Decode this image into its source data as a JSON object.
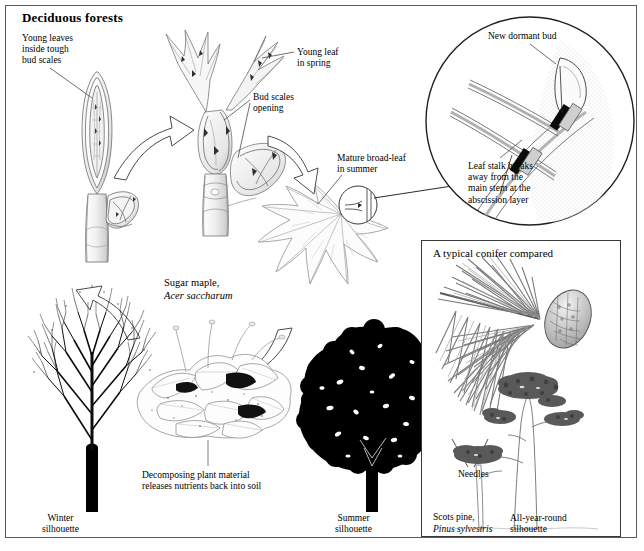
{
  "figure": {
    "title": "Deciduous forests",
    "subject_common_name": "Sugar maple,",
    "subject_latin_name": "Acer saccharum"
  },
  "labels": {
    "young_leaves": "Young leaves\ninside tough\nbud scales",
    "young_leaf_spring": "Young leaf\nin spring",
    "bud_scales_opening": "Bud scales\nopening",
    "mature_leaf_summer": "Mature broad-leaf\nin summer",
    "new_dormant_bud": "New dormant bud",
    "leaf_stalk_breaks": "Leaf stalk breaks\naway from the\nmain stem at the\nabscission layer",
    "decomposing": "Decomposing plant material\nreleases nutrients back into soil",
    "winter_silhouette": "Winter\nsilhouette",
    "summer_silhouette": "Summer\nsilhouette",
    "sugar_maple_common": "Sugar maple,",
    "sugar_maple_latin": "Acer saccharum"
  },
  "conifer_panel": {
    "title": "A typical conifer compared",
    "needles_label": "Needles",
    "silhouette_label": "All-year-round\nsilhouette",
    "common_name": "Scots pine,",
    "latin_name": "Pinus sylvestris"
  },
  "colors": {
    "ink": "#000000",
    "frame": "#5a5a5a",
    "panel_border": "#3a3a3a",
    "line_art": "#7a7a7a",
    "silhouette": "#000000",
    "shade_light": "#d8d8d8",
    "shade_mid": "#9a9a9a",
    "paper": "#ffffff"
  },
  "icons": {
    "cycle_arrow": "curved-arrow-icon",
    "detail_circle": "magnifier-circle-icon",
    "leader_line": "leader-line-icon"
  }
}
